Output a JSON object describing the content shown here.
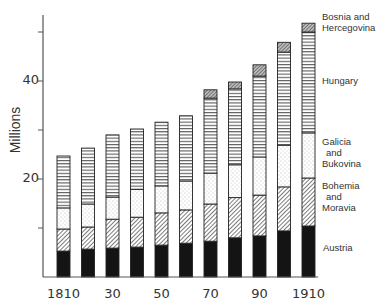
{
  "chart_data": {
    "type": "bar",
    "stacked": true,
    "title": "",
    "xlabel": "",
    "ylabel": "Millions",
    "ylim": [
      0,
      55
    ],
    "yticks": [
      10,
      20,
      30,
      40,
      50
    ],
    "ytick_labels": {
      "20": "20",
      "40": "40"
    },
    "categories": [
      "1810",
      "1820",
      "1830",
      "1840",
      "1850",
      "1860",
      "1870",
      "1880",
      "1890",
      "1900",
      "1910"
    ],
    "xtick_labels": [
      "1810",
      "30",
      "50",
      "70",
      "90",
      "1910"
    ],
    "xtick_positions": [
      0,
      2,
      4,
      6,
      8,
      10
    ],
    "grid": false,
    "legend_position": "right, labels aligned to last bar",
    "series": [
      {
        "name": "Austria",
        "pattern": "solid",
        "values": [
          5.3,
          5.7,
          5.9,
          6.1,
          6.5,
          6.9,
          7.3,
          8.0,
          8.4,
          9.4,
          10.4
        ]
      },
      {
        "name": "Bohemia and Moravia",
        "pattern": "diagonal",
        "values": [
          4.5,
          4.5,
          5.9,
          6.1,
          6.6,
          6.8,
          7.6,
          8.2,
          8.3,
          9.0,
          9.8
        ]
      },
      {
        "name": "Galicia and Bukovina",
        "pattern": "stipple",
        "values": [
          4.3,
          4.7,
          4.5,
          5.7,
          5.5,
          5.9,
          6.3,
          6.7,
          7.8,
          8.5,
          9.2
        ]
      },
      {
        "name": "Hungary",
        "pattern": "horizontal",
        "values": [
          10.6,
          11.4,
          12.7,
          12.3,
          13.0,
          13.3,
          15.3,
          15.5,
          16.5,
          19.0,
          20.6
        ]
      },
      {
        "name": "Bosnia and Hercegovina",
        "pattern": "crosshatch",
        "values": [
          0,
          0,
          0,
          0,
          0,
          0,
          1.7,
          1.4,
          2.3,
          2.0,
          1.8
        ]
      }
    ],
    "totals": [
      24.7,
      26.3,
      29.0,
      30.2,
      31.6,
      32.9,
      38.2,
      39.8,
      43.3,
      47.9,
      51.8
    ]
  },
  "legend": {
    "bosnia": [
      "Bosnia and",
      "Hercegovina"
    ],
    "hungary": [
      "Hungary"
    ],
    "galicia": [
      "Galicia",
      "and",
      "Bukovina"
    ],
    "bohemia": [
      "Bohemia",
      "and",
      "Moravia"
    ],
    "austria": [
      "Austria"
    ]
  },
  "axis": {
    "ylabel": "Millions",
    "y40": "40",
    "y20": "20"
  },
  "colors": {
    "ink": "#1a1a1a",
    "axis": "#555555",
    "background": "#ffffff"
  }
}
